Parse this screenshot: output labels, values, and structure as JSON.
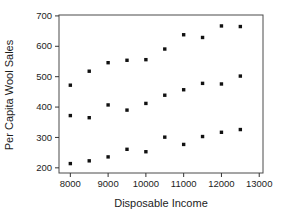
{
  "chart_data": {
    "type": "scatter",
    "title": "",
    "xlabel": "Disposable Income",
    "ylabel": "Per Capita Wool Sales",
    "xlim": [
      7700,
      13100
    ],
    "ylim": [
      183,
      703
    ],
    "x_ticks": [
      8000,
      9000,
      10000,
      11000,
      12000,
      13000
    ],
    "y_ticks": [
      200,
      300,
      400,
      500,
      600,
      700
    ],
    "grid": false,
    "legend": false,
    "marker": "filled-square",
    "marker_color": "#111111",
    "frame_color": "#4a4a4a",
    "tick_color": "#333333",
    "x": [
      8000,
      8500,
      9000,
      9500,
      10000,
      10500,
      11000,
      11500,
      12000,
      12500
    ],
    "series": [
      {
        "name": "upper-band",
        "values": [
          472,
          518,
          546,
          554,
          556,
          591,
          638,
          629,
          667,
          665
        ]
      },
      {
        "name": "middle-band",
        "values": [
          372,
          365,
          407,
          390,
          412,
          439,
          457,
          478,
          476,
          502
        ]
      },
      {
        "name": "lower-band",
        "values": [
          214,
          223,
          236,
          261,
          253,
          301,
          277,
          303,
          317,
          326
        ]
      }
    ]
  }
}
